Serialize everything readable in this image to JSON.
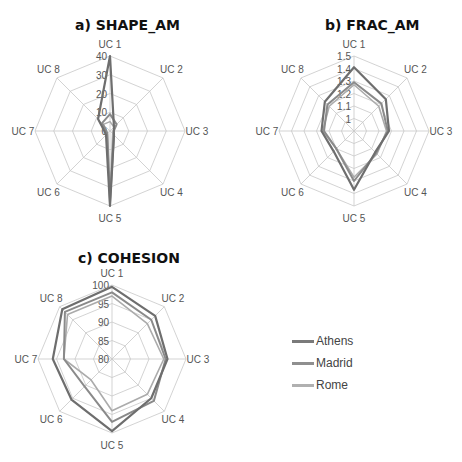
{
  "chart_data": [
    {
      "type": "radar",
      "title": "a) SHAPE_AM",
      "categories": [
        "UC 1",
        "UC 2",
        "UC 3",
        "UC 4",
        "UC 5",
        "UC 6",
        "UC 7",
        "UC 8"
      ],
      "rmin": 0,
      "rmax": 40,
      "ticks": [
        0,
        10,
        20,
        30,
        40
      ],
      "tick_labels": [
        "0",
        "10",
        "20",
        "30",
        "40"
      ],
      "ring_values": [
        10,
        20,
        30,
        40
      ],
      "series": [
        {
          "name": "Athens",
          "values": [
            40,
            3,
            2,
            3,
            40,
            3,
            3,
            9
          ]
        },
        {
          "name": "Madrid",
          "values": [
            9,
            5,
            2,
            3,
            38,
            2,
            2,
            6
          ]
        },
        {
          "name": "Rome",
          "values": [
            5,
            3,
            2,
            2,
            36,
            2,
            2,
            5
          ]
        }
      ]
    },
    {
      "type": "radar",
      "title": "b) FRAC_AM",
      "categories": [
        "UC 1",
        "UC 2",
        "UC 3",
        "UC 4",
        "UC 5",
        "UC 6",
        "UC 7",
        "UC 8"
      ],
      "rmin": 0.9,
      "rmax": 1.5,
      "ticks": [
        1,
        1.1,
        1.2,
        1.3,
        1.4,
        1.5
      ],
      "tick_labels": [
        "1",
        "1.1",
        "1.2",
        "1.3",
        "1.4",
        "1.5"
      ],
      "ring_values": [
        1,
        1.1,
        1.2,
        1.3,
        1.4,
        1.5
      ],
      "series": [
        {
          "name": "Athens",
          "values": [
            1.41,
            1.26,
            1.18,
            1.14,
            1.37,
            1.13,
            1.16,
            1.23
          ]
        },
        {
          "name": "Madrid",
          "values": [
            1.29,
            1.21,
            1.17,
            1.15,
            1.3,
            1.1,
            1.14,
            1.2
          ]
        },
        {
          "name": "Rome",
          "values": [
            1.27,
            1.18,
            1.16,
            1.16,
            1.27,
            1.1,
            1.15,
            1.18
          ]
        }
      ]
    },
    {
      "type": "radar",
      "title": "c) COHESION",
      "categories": [
        "UC 1",
        "UC 2",
        "UC 3",
        "UC 4",
        "UC 5",
        "UC 6",
        "UC 7",
        "UC 8"
      ],
      "rmin": 80,
      "rmax": 100,
      "ticks": [
        80,
        85,
        90,
        95,
        100
      ],
      "tick_labels": [
        "80",
        "85",
        "90",
        "95",
        "100"
      ],
      "ring_values": [
        85,
        90,
        95,
        100
      ],
      "series": [
        {
          "name": "Athens",
          "values": [
            99.5,
            96.5,
            95,
            95,
            99.5,
            95.5,
            96,
            99
          ]
        },
        {
          "name": "Madrid",
          "values": [
            98,
            95,
            94.5,
            96,
            97,
            90.5,
            93,
            98
          ]
        },
        {
          "name": "Rome",
          "values": [
            97,
            93.5,
            94,
            93.5,
            94,
            88,
            93,
            97
          ]
        }
      ]
    }
  ],
  "legend": {
    "position": "right of chart c",
    "items": [
      {
        "label": "Athens",
        "color": "#7a7a7a"
      },
      {
        "label": "Madrid",
        "color": "#8f8f8f"
      },
      {
        "label": "Rome",
        "color": "#b0b0b0"
      }
    ]
  },
  "series_colors": {
    "Athens": "#6e6e6e",
    "Madrid": "#8a8a8a",
    "Rome": "#ababab"
  },
  "grid_color": "#c8c8c8"
}
